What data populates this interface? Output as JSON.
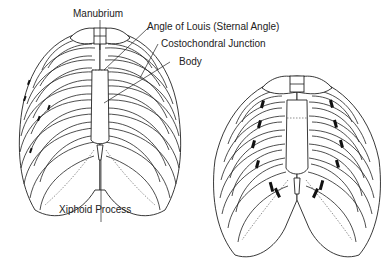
{
  "figure": {
    "panels": [
      {
        "id": "left",
        "description": "Normal rib cage with sternal landmarks labeled"
      },
      {
        "id": "right",
        "description": "Rib cage with darkened costochondral junction markings"
      }
    ]
  },
  "labels": {
    "manubrium": "Manubrium",
    "angle_of_louis": "Angle of Louis (Sternal Angle)",
    "costochondral_junction": "Costochondral Junction",
    "body": "Body",
    "xiphoid_process": "Xiphoid Process"
  },
  "colors": {
    "line": "#222222",
    "background": "#ffffff"
  }
}
